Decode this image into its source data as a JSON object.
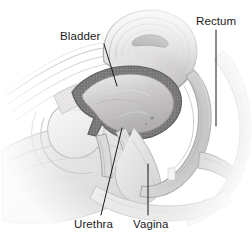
{
  "figure": {
    "type": "medical-illustration",
    "view": "midsagittal cross-section",
    "style": "grayscale pencil-shaded line drawing",
    "background_color": "#ffffff",
    "width": 252,
    "height": 247
  },
  "labels": {
    "bladder": "Bladder",
    "rectum": "Rectum",
    "urethra": "Urethra",
    "vagina": "Vagina"
  },
  "label_color": "#1a1a1a",
  "leader_color": "#1a1a1a",
  "palette": {
    "outline": "#8c8c8c",
    "light_tissue": "#eceaea",
    "mid_tissue": "#d2d0d0",
    "dark_tissue": "#a8a6a6",
    "bladder_wall": "#737373",
    "bladder_cavity": "#c9c7c7",
    "bone": "#f4f3f3",
    "shadow": "#9a9898"
  },
  "structures": [
    {
      "name": "bladder",
      "description": "dome-shaped organ with thick speckled dark wall and pale gradient-shaded cavity"
    },
    {
      "name": "rectum",
      "description": "curved tubular canal on right side with concentric layered striations"
    },
    {
      "name": "urethra",
      "description": "narrow channel descending from bladder neck toward lower left"
    },
    {
      "name": "vagina",
      "description": "canal running downward between urethra and rectum"
    },
    {
      "name": "uterus",
      "description": "large curved looped organ above the bladder"
    },
    {
      "name": "pubic-bone",
      "description": "pale oval bone at left"
    },
    {
      "name": "abdominal-wall",
      "description": "layered tissue bands at far left"
    }
  ]
}
